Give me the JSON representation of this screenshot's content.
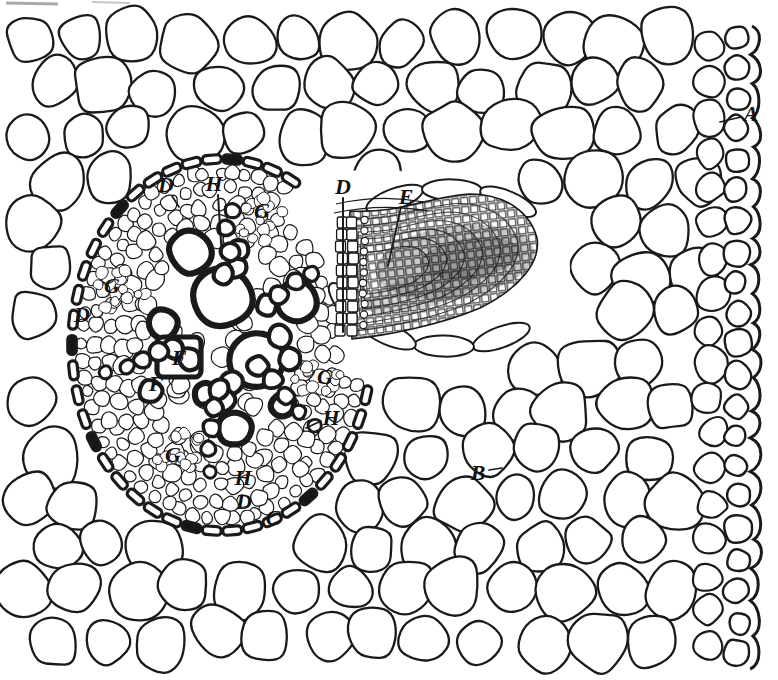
{
  "figure": {
    "alt": "Transverse section of a root with a lateral root primordium arising from the stele and pushing outward through the cortex toward the epidermis",
    "paper_color": "#ffffff",
    "ink_color": "#1a1a1a",
    "label_color": "#121212"
  },
  "labels": [
    {
      "letter": "A",
      "x": 751,
      "y": 113,
      "leader": [
        [
          741,
          117
        ],
        [
          720,
          122
        ]
      ]
    },
    {
      "letter": "B",
      "x": 478,
      "y": 472,
      "leader": [
        [
          489,
          470
        ],
        [
          502,
          468
        ]
      ]
    },
    {
      "letter": "C",
      "x": 273,
      "y": 517,
      "leader": null
    },
    {
      "letter": "D",
      "x": 166,
      "y": 184,
      "leader": [
        [
          172,
          196
        ],
        [
          179,
          207
        ]
      ]
    },
    {
      "letter": "D",
      "x": 82,
      "y": 314,
      "leader": null
    },
    {
      "letter": "D",
      "x": 343,
      "y": 186,
      "leader": [
        [
          343,
          198
        ],
        [
          343,
          332
        ]
      ]
    },
    {
      "letter": "D",
      "x": 244,
      "y": 501,
      "leader": null
    },
    {
      "letter": "E",
      "x": 406,
      "y": 196,
      "leader": [
        [
          401,
          207
        ],
        [
          388,
          266
        ]
      ]
    },
    {
      "letter": "F",
      "x": 179,
      "y": 357,
      "leader": null
    },
    {
      "letter": "F",
      "x": 156,
      "y": 383,
      "leader": null
    },
    {
      "letter": "G",
      "x": 262,
      "y": 210,
      "leader": null
    },
    {
      "letter": "G",
      "x": 112,
      "y": 285,
      "leader": null
    },
    {
      "letter": "G",
      "x": 325,
      "y": 376,
      "leader": null
    },
    {
      "letter": "G",
      "x": 173,
      "y": 454,
      "leader": null
    },
    {
      "letter": "H",
      "x": 214,
      "y": 183,
      "leader": [
        [
          218,
          195
        ],
        [
          222,
          258
        ]
      ]
    },
    {
      "letter": "H",
      "x": 331,
      "y": 417,
      "leader": [
        [
          321,
          421
        ],
        [
          306,
          428
        ]
      ]
    },
    {
      "letter": "H",
      "x": 243,
      "y": 477,
      "leader": null
    }
  ]
}
